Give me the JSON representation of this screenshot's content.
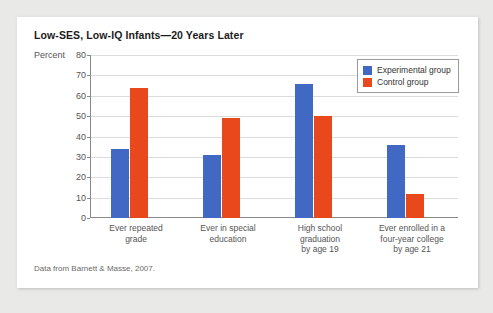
{
  "card": {
    "title": "Low-SES, Low-IQ Infants—20 Years Later",
    "source_note": "Data from Barnett & Masse, 2007."
  },
  "colors": {
    "experimental": "#4169c4",
    "control": "#e8481c",
    "page_background": "#e9e9e7",
    "card_background": "#ffffff",
    "gridline": "#dcdcdc",
    "axis": "#8a8a8a"
  },
  "chart_data": {
    "type": "bar",
    "title": "Low-SES, Low-IQ Infants—20 Years Later",
    "xlabel": "",
    "ylabel": "Percent",
    "ylim": [
      0,
      80
    ],
    "yticks": [
      0,
      10,
      20,
      30,
      40,
      50,
      60,
      70,
      80
    ],
    "ytick_labels": [
      "0",
      "10",
      "20",
      "30",
      "40",
      "50",
      "60",
      "70",
      "80"
    ],
    "grid": true,
    "legend_position": "top-right",
    "categories": [
      "Ever repeated grade",
      "Ever in special education",
      "High school graduation by age 19",
      "Ever enrolled in a four-year college by age 21"
    ],
    "category_lines": [
      [
        "Ever repeated",
        "grade"
      ],
      [
        "Ever in special",
        "education"
      ],
      [
        "High school",
        "graduation",
        "by age 19"
      ],
      [
        "Ever enrolled in a",
        "four-year college",
        "by age 21"
      ]
    ],
    "series": [
      {
        "name": "Experimental group",
        "color": "#4169c4",
        "values": [
          34,
          31,
          66,
          36
        ]
      },
      {
        "name": "Control group",
        "color": "#e8481c",
        "values": [
          64,
          49,
          50,
          12
        ]
      }
    ],
    "annotation": "Data from Barnett & Masse, 2007."
  }
}
